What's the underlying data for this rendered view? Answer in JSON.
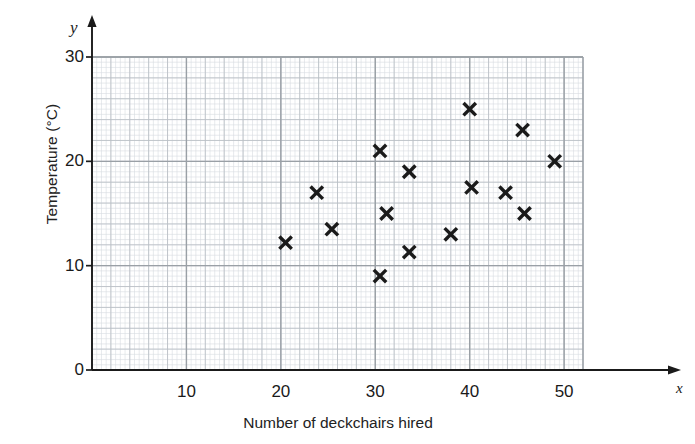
{
  "chart_data": {
    "type": "scatter",
    "title": "",
    "xlabel": "Number of deckchairs hired",
    "ylabel": "Temperature (°C)",
    "x_axis_letter": "x",
    "y_axis_letter": "y",
    "xlim": [
      0,
      52
    ],
    "ylim": [
      0,
      30
    ],
    "xticks": [
      10,
      20,
      30,
      40,
      50
    ],
    "yticks": [
      0,
      10,
      20,
      30
    ],
    "xtick_labels": [
      "10",
      "20",
      "30",
      "40",
      "50"
    ],
    "ytick_labels": [
      "0",
      "10",
      "20",
      "30"
    ],
    "grid": true,
    "grid_minor_step_x": 0.5,
    "grid_minor_step_y": 0.5,
    "grid_major_step_x": 2,
    "grid_major_step_y": 2,
    "legend": null,
    "marker": "x-cross",
    "marker_color": "#1a1a1a",
    "points": [
      {
        "x": 20.5,
        "y": 12.2
      },
      {
        "x": 23.8,
        "y": 17.0
      },
      {
        "x": 25.4,
        "y": 13.5
      },
      {
        "x": 30.5,
        "y": 21.0
      },
      {
        "x": 30.5,
        "y": 9.0
      },
      {
        "x": 31.2,
        "y": 15.0
      },
      {
        "x": 33.6,
        "y": 19.0
      },
      {
        "x": 33.6,
        "y": 11.3
      },
      {
        "x": 38.0,
        "y": 13.0
      },
      {
        "x": 40.0,
        "y": 25.0
      },
      {
        "x": 40.2,
        "y": 17.5
      },
      {
        "x": 43.8,
        "y": 17.0
      },
      {
        "x": 45.6,
        "y": 23.0
      },
      {
        "x": 45.8,
        "y": 15.0
      },
      {
        "x": 49.0,
        "y": 20.0
      }
    ]
  },
  "style": {
    "axis_color": "#1a1a1a",
    "grid_major_color": "#9aa0a6",
    "grid_minor_color": "#d7dce0",
    "background": "#ffffff"
  }
}
